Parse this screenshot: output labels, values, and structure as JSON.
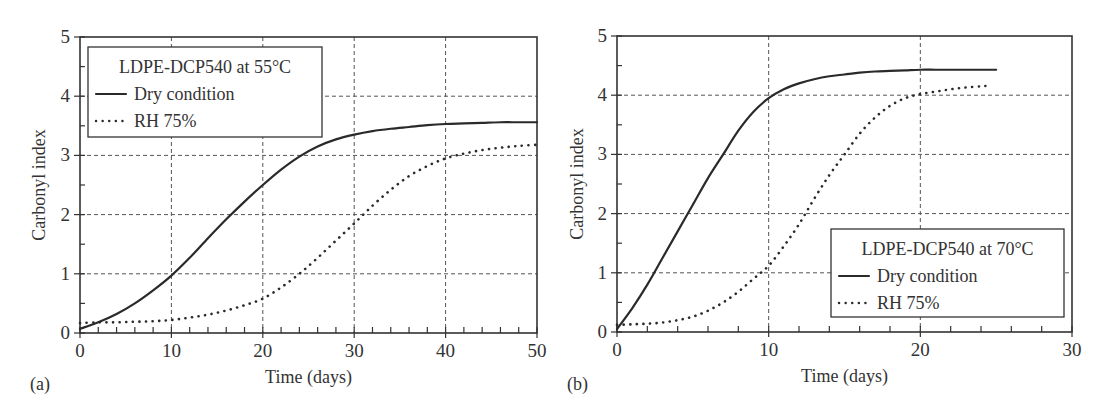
{
  "chart_data": [
    {
      "type": "line",
      "panel_label": "(a)",
      "title": "",
      "xlabel": "Time (days)",
      "ylabel": "Carbonyl index",
      "xlim": [
        0,
        50
      ],
      "ylim": [
        0,
        5
      ],
      "xticks": [
        0,
        10,
        20,
        30,
        40,
        50
      ],
      "yticks": [
        0,
        1,
        2,
        3,
        4,
        5
      ],
      "x_minor_step": 2,
      "y_minor_step": 0.5,
      "grid": true,
      "legend": {
        "title": "LDPE-DCP540 at 55°C",
        "position": "upper left",
        "entries": [
          "Dry condition",
          "RH 75%"
        ]
      },
      "series": [
        {
          "name": "Dry condition",
          "style": "solid",
          "x": [
            0,
            2,
            4,
            6,
            8,
            10,
            12,
            14,
            16,
            18,
            20,
            22,
            24,
            26,
            28,
            30,
            32,
            34,
            36,
            38,
            40,
            42,
            44,
            46,
            48,
            50
          ],
          "y": [
            0.07,
            0.18,
            0.32,
            0.5,
            0.72,
            0.97,
            1.27,
            1.6,
            1.92,
            2.22,
            2.5,
            2.76,
            2.98,
            3.15,
            3.27,
            3.35,
            3.41,
            3.45,
            3.48,
            3.51,
            3.53,
            3.54,
            3.55,
            3.56,
            3.56,
            3.56
          ]
        },
        {
          "name": "RH 75%",
          "style": "dotted",
          "x": [
            0,
            2,
            4,
            6,
            8,
            10,
            12,
            14,
            16,
            18,
            20,
            22,
            24,
            26,
            28,
            30,
            32,
            34,
            36,
            38,
            40,
            42,
            44,
            46,
            48,
            50
          ],
          "y": [
            0.17,
            0.18,
            0.18,
            0.19,
            0.2,
            0.22,
            0.26,
            0.31,
            0.38,
            0.47,
            0.58,
            0.77,
            1.0,
            1.27,
            1.56,
            1.85,
            2.15,
            2.42,
            2.65,
            2.82,
            2.95,
            3.03,
            3.09,
            3.13,
            3.16,
            3.18
          ]
        }
      ]
    },
    {
      "type": "line",
      "panel_label": "(b)",
      "title": "",
      "xlabel": "Time (days)",
      "ylabel": "Carbonyl index",
      "xlim": [
        0,
        30
      ],
      "ylim": [
        0,
        5
      ],
      "xticks": [
        0,
        10,
        20,
        30
      ],
      "yticks": [
        0,
        1,
        2,
        3,
        4,
        5
      ],
      "x_minor_step": 2,
      "y_minor_step": 0.5,
      "grid": true,
      "legend": {
        "title": "LDPE-DCP540 at 70°C",
        "position": "lower right",
        "entries": [
          "Dry condition",
          "RH 75%"
        ]
      },
      "series": [
        {
          "name": "Dry condition",
          "style": "solid",
          "x": [
            0,
            1,
            2,
            3,
            4,
            5,
            6,
            7,
            8,
            9,
            10,
            11,
            12,
            13,
            14,
            15,
            16,
            17,
            18,
            19,
            20,
            21,
            22,
            23,
            24,
            25
          ],
          "y": [
            0.05,
            0.4,
            0.8,
            1.25,
            1.7,
            2.15,
            2.6,
            3.0,
            3.4,
            3.72,
            3.95,
            4.1,
            4.2,
            4.27,
            4.32,
            4.35,
            4.38,
            4.4,
            4.41,
            4.42,
            4.43,
            4.43,
            4.43,
            4.43,
            4.43,
            4.43
          ]
        },
        {
          "name": "RH 75%",
          "style": "dotted",
          "x": [
            0,
            1,
            2,
            3,
            4,
            5,
            6,
            7,
            8,
            9,
            10,
            11,
            12,
            13,
            14,
            15,
            16,
            17,
            18,
            19,
            20,
            21,
            22,
            23,
            24,
            24.5
          ],
          "y": [
            0.12,
            0.13,
            0.14,
            0.16,
            0.2,
            0.26,
            0.36,
            0.5,
            0.68,
            0.9,
            1.12,
            1.45,
            1.82,
            2.25,
            2.65,
            3.0,
            3.35,
            3.62,
            3.82,
            3.95,
            4.02,
            4.06,
            4.1,
            4.13,
            4.15,
            4.16
          ]
        }
      ]
    }
  ]
}
